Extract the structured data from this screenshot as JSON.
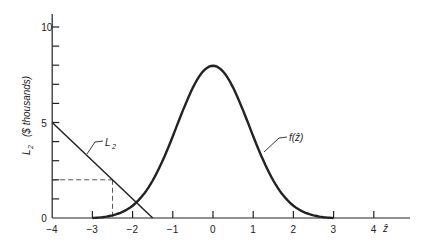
{
  "chart_data": {
    "type": "line",
    "title": "",
    "xlabel": "ẑ",
    "ylabel": "L2 ($ thousands)",
    "xlim": [
      -4,
      4.5
    ],
    "ylim": [
      0,
      10
    ],
    "xticks": [
      -4,
      -3,
      -2,
      -1,
      0,
      1,
      2,
      3,
      4
    ],
    "yticks": [
      0,
      5,
      10
    ],
    "grid": false,
    "series": [
      {
        "name": "L2",
        "type": "line",
        "x": [
          -4,
          -1.5
        ],
        "y": [
          5,
          0
        ]
      },
      {
        "name": "f(ẑ)",
        "type": "curve",
        "x": [
          -3,
          -2,
          -1,
          0,
          1,
          2,
          3
        ],
        "y": [
          0,
          0.9,
          3.4,
          8,
          3.4,
          0.9,
          0
        ]
      }
    ],
    "annotations": [
      {
        "type": "dashed-guide",
        "from": [
          -4,
          2
        ],
        "to": [
          -2.5,
          2
        ]
      },
      {
        "type": "dashed-guide",
        "from": [
          -2.5,
          2
        ],
        "to": [
          -2.5,
          0
        ]
      },
      {
        "text": "L2",
        "target": "L2 line"
      },
      {
        "text": "f(ẑ)",
        "target": "normal curve"
      }
    ]
  },
  "labels": {
    "ylabel_main": "L",
    "ylabel_sub": "2",
    "ylabel_units": "($ thousands)",
    "xlabel": "ẑ",
    "line_label": "L",
    "line_label_sub": "2",
    "curve_label": "f(ẑ)"
  }
}
